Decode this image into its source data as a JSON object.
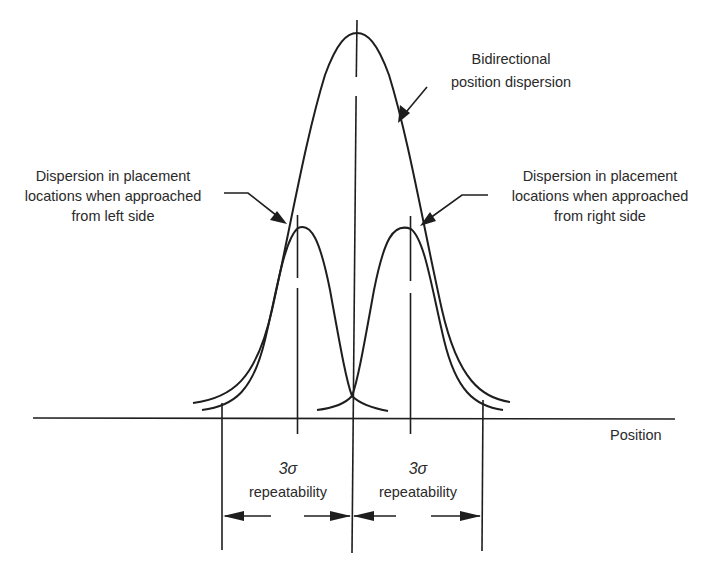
{
  "diagram": {
    "labels": {
      "bidirectional": [
        "Bidirectional",
        "position dispersion"
      ],
      "left_dispersion": [
        "Dispersion in placement",
        "locations when approached",
        "from left side"
      ],
      "right_dispersion": [
        "Dispersion in placement",
        "locations when approached",
        "from right side"
      ],
      "axis": "Position",
      "left_interval": {
        "sigma": "3σ",
        "text": "repeatability"
      },
      "right_interval": {
        "sigma": "3σ",
        "text": "repeatability"
      }
    },
    "elements": {
      "big_curve": "Bidirectional position dispersion distribution (wide bell curve centered at mean)",
      "left_curve": "Narrow bell curve - approached from left side",
      "right_curve": "Narrow bell curve - approached from right side",
      "center_line": "Mean position center line",
      "dimension_arrows": "3 sigma repeatability intervals on each side"
    },
    "colors": {
      "line": "#1e1e1e",
      "text": "#2a2a2a",
      "background": "#ffffff"
    }
  }
}
